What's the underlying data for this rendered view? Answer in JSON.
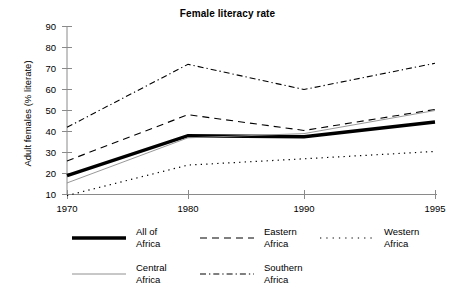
{
  "chart_data": {
    "type": "line",
    "title": "Female literacy rate",
    "xlabel": "",
    "ylabel": "Adult females (% literate)",
    "x": [
      "1970",
      "1980",
      "1990",
      "1995"
    ],
    "categories": [
      "1970",
      "1980",
      "1990",
      "1995"
    ],
    "xticklabels": [
      "1970",
      "1980",
      "1990",
      "1995"
    ],
    "yticklabels": [
      "10",
      "20",
      "30",
      "40",
      "50",
      "60",
      "70",
      "80",
      "90"
    ],
    "yticks": [
      10,
      20,
      30,
      40,
      50,
      60,
      70,
      80,
      90
    ],
    "ylim": [
      10,
      90
    ],
    "grid": false,
    "legend_position": "below",
    "series": [
      {
        "name": "All of\nAfrica",
        "label": "All of\nAfrica",
        "style": "solid-thick",
        "values": [
          19,
          38,
          37.5,
          44.5
        ]
      },
      {
        "name": "Eastern\nAfrica",
        "label": "Eastern\nAfrica",
        "style": "dashed",
        "values": [
          26,
          48,
          40.5,
          50.5
        ]
      },
      {
        "name": "Western\nAfrica",
        "label": "Western\nAfrica",
        "style": "dotted",
        "values": [
          9.5,
          24,
          27,
          30.5
        ]
      },
      {
        "name": "Central\nAfrica",
        "label": "Central\nAfrica",
        "style": "solid-thin",
        "values": [
          15.5,
          37,
          39,
          50
        ]
      },
      {
        "name": "Southern\nAfrica",
        "label": "Southern\nAfrica",
        "style": "dash-dot",
        "values": [
          42,
          72,
          60,
          72.5
        ]
      }
    ]
  },
  "axis": {
    "y_label": "Adult females (% literate)"
  },
  "colors": {
    "line": "#000000",
    "axis": "#808080",
    "background": "#ffffff",
    "thin_line": "#909090"
  }
}
